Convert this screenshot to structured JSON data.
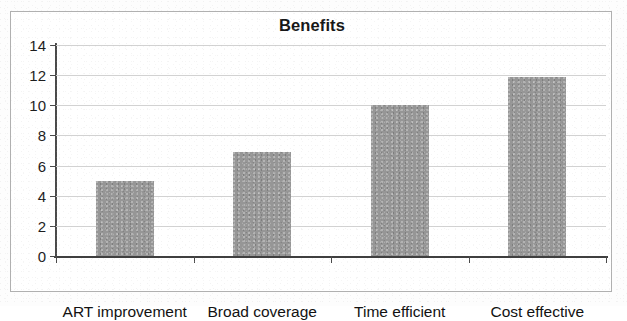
{
  "chart_data": {
    "type": "bar",
    "title": "Benefits",
    "xlabel": "",
    "ylabel": "",
    "categories": [
      "ART improvement",
      "Broad coverage",
      "Time efficient",
      "Cost effective"
    ],
    "values": [
      5,
      6.9,
      10,
      11.9
    ],
    "ylim": [
      0,
      14
    ],
    "ytick_labels": [
      "0",
      "2",
      "4",
      "6",
      "8",
      "10",
      "12",
      "14"
    ],
    "ytick_values": [
      0,
      2,
      4,
      6,
      8,
      10,
      12,
      14
    ],
    "grid": true,
    "legend": false,
    "series": [
      {
        "name": "Benefits",
        "values": [
          5,
          6.9,
          10,
          11.9
        ]
      }
    ],
    "colors": {
      "bar": "#969696",
      "gridline": "#d2d2d2",
      "axis": "#4a4a4a",
      "text": "#121212",
      "frame": "#b0b0b0",
      "background": "#ffffff"
    }
  }
}
